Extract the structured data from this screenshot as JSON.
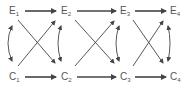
{
  "diagram": {
    "colors": {
      "line": "#444444",
      "text": "#555555",
      "background": "#ffffff"
    },
    "top_row": [
      {
        "letter": "E",
        "sub": "1"
      },
      {
        "letter": "E",
        "sub": "2"
      },
      {
        "letter": "E",
        "sub": "3"
      },
      {
        "letter": "E",
        "sub": "4"
      }
    ],
    "bottom_row": [
      {
        "letter": "C",
        "sub": "1"
      },
      {
        "letter": "C",
        "sub": "2"
      },
      {
        "letter": "C",
        "sub": "3"
      },
      {
        "letter": "C",
        "sub": "4"
      }
    ],
    "edges": [
      {
        "from": "E1",
        "to": "E2",
        "type": "straight"
      },
      {
        "from": "E2",
        "to": "E3",
        "type": "straight"
      },
      {
        "from": "E3",
        "to": "E4",
        "type": "straight"
      },
      {
        "from": "C1",
        "to": "C2",
        "type": "straight"
      },
      {
        "from": "C2",
        "to": "C3",
        "type": "straight"
      },
      {
        "from": "C3",
        "to": "C4",
        "type": "straight"
      },
      {
        "from": "E1",
        "to": "C2",
        "type": "diagonal"
      },
      {
        "from": "C1",
        "to": "E2",
        "type": "diagonal"
      },
      {
        "from": "E2",
        "to": "C3",
        "type": "diagonal"
      },
      {
        "from": "C2",
        "to": "E3",
        "type": "diagonal"
      },
      {
        "from": "E3",
        "to": "C4",
        "type": "diagonal"
      },
      {
        "from": "C3",
        "to": "E4",
        "type": "diagonal"
      },
      {
        "from": "E1",
        "to": "C1",
        "type": "curved-bidirectional"
      },
      {
        "from": "E2",
        "to": "C2",
        "type": "curved-bidirectional"
      },
      {
        "from": "E3",
        "to": "C3",
        "type": "curved-bidirectional"
      },
      {
        "from": "E4",
        "to": "C4",
        "type": "curved-bidirectional"
      }
    ]
  }
}
